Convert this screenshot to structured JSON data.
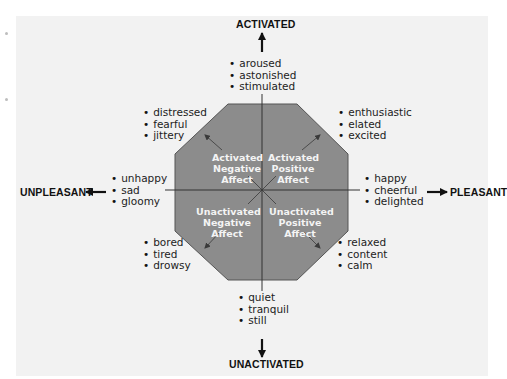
{
  "diagram": {
    "axes": {
      "top": "ACTIVATED",
      "bottom": "UNACTIVATED",
      "left": "UNPLEASANT",
      "right": "PLEASANT"
    },
    "quadrants": [
      {
        "id": "activated-negative",
        "lines": [
          "Activated",
          "Negative",
          "Affect"
        ]
      },
      {
        "id": "activated-positive",
        "lines": [
          "Activated",
          "Positive",
          "Affect"
        ]
      },
      {
        "id": "unactivated-negative",
        "lines": [
          "Unactivated",
          "Negative",
          "Affect"
        ]
      },
      {
        "id": "unactivated-positive",
        "lines": [
          "Unactivated",
          "Positive",
          "Affect"
        ]
      }
    ],
    "emotion_groups": {
      "top": [
        "aroused",
        "astonished",
        "stimulated"
      ],
      "top_left": [
        "distressed",
        "fearful",
        "jittery"
      ],
      "top_right": [
        "enthusiastic",
        "elated",
        "excited"
      ],
      "left": [
        "unhappy",
        "sad",
        "gloomy"
      ],
      "right": [
        "happy",
        "cheerful",
        "delighted"
      ],
      "bottom_left": [
        "bored",
        "tired",
        "drowsy"
      ],
      "bottom_right": [
        "relaxed",
        "content",
        "calm"
      ],
      "bottom": [
        "quiet",
        "tranquil",
        "still"
      ]
    },
    "colors": {
      "octagon_fill": "#8c8c8c",
      "octagon_stroke": "#555555",
      "panel_bg": "#f2f2f2",
      "quadrant_text": "#f4f4f4",
      "axis_text": "#111111"
    }
  }
}
